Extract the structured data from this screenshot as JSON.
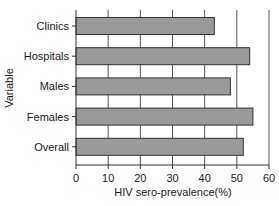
{
  "chart_data": {
    "type": "bar",
    "orientation": "horizontal",
    "title": "",
    "xlabel": "HIV sero-prevalence(%)",
    "ylabel": "Variable",
    "categories": [
      "Clinics",
      "Hospitals",
      "Males",
      "Females",
      "Overall"
    ],
    "values": [
      43,
      54,
      48,
      55,
      52
    ],
    "xlim": [
      0,
      60
    ],
    "xticks": [
      0,
      10,
      20,
      30,
      40,
      50,
      60
    ],
    "grid": "vertical",
    "legend": "none",
    "bar_color": "#9a9a9a",
    "bar_edge_color": "#333333",
    "grid_color": "#555555"
  }
}
